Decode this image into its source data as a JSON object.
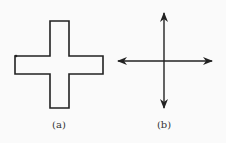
{
  "figures": [
    {
      "id": "a",
      "label": "(a)",
      "shape": "plus-outline",
      "description": "Closed cross/plus-shaped outline"
    },
    {
      "id": "b",
      "label": "(b)",
      "shape": "four-arrow-cross",
      "description": "Two perpendicular double-headed arrows crossing"
    }
  ],
  "colors": {
    "stroke": "#222222",
    "background": "#fafafa"
  }
}
